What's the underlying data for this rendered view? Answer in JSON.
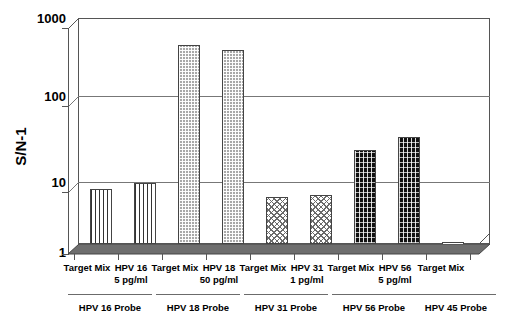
{
  "chart_data": {
    "type": "bar",
    "title": "",
    "xlabel": "",
    "ylabel": "S/N-1",
    "yscale": "log",
    "ylim": [
      1,
      1000
    ],
    "yticks": [
      "1000",
      "100",
      "10",
      "1"
    ],
    "grid": true,
    "legend": "none",
    "categories": [
      "Target Mix",
      "HPV 16 5 pg/ml",
      "Target Mix",
      "HPV 18 50 pg/ml",
      "Target Mix",
      "HPV 31 1 pg/ml",
      "Target Mix",
      "HPV 56 5 pg/ml",
      "Target Mix"
    ],
    "values": [
      4.4,
      5.1,
      205,
      178,
      3.5,
      3.7,
      12.5,
      17.5,
      1.0
    ],
    "bars": [
      {
        "label_line1": "Target Mix",
        "label_line2": "",
        "value": 4.4,
        "pattern": "vertical-lines",
        "group": "HPV 16 Probe"
      },
      {
        "label_line1": "HPV 16",
        "label_line2": "5 pg/ml",
        "value": 5.1,
        "pattern": "vertical-lines",
        "group": "HPV 16 Probe"
      },
      {
        "label_line1": "Target Mix",
        "label_line2": "",
        "value": 205,
        "pattern": "gray-stipple",
        "group": "HPV 18 Probe"
      },
      {
        "label_line1": "HPV 18",
        "label_line2": "50 pg/ml",
        "value": 178,
        "pattern": "gray-stipple",
        "group": "HPV 18 Probe"
      },
      {
        "label_line1": "Target Mix",
        "label_line2": "",
        "value": 3.5,
        "pattern": "wave",
        "group": "HPV 31 Probe"
      },
      {
        "label_line1": "HPV 31",
        "label_line2": "1 pg/ml",
        "value": 3.7,
        "pattern": "wave",
        "group": "HPV 31 Probe"
      },
      {
        "label_line1": "Target Mix",
        "label_line2": "",
        "value": 12.5,
        "pattern": "dark-stipple",
        "group": "HPV 56 Probe"
      },
      {
        "label_line1": "HPV 56",
        "label_line2": "5 pg/ml",
        "value": 17.5,
        "pattern": "dark-stipple",
        "group": "HPV 56 Probe"
      },
      {
        "label_line1": "Target Mix",
        "label_line2": "",
        "value": 1.0,
        "pattern": "empty",
        "group": "HPV 45 Probe"
      }
    ],
    "groups": [
      {
        "label": "HPV 16 Probe",
        "bars": [
          0,
          1
        ]
      },
      {
        "label": "HPV 18 Probe",
        "bars": [
          2,
          3
        ]
      },
      {
        "label": "HPV 31 Probe",
        "bars": [
          4,
          5
        ]
      },
      {
        "label": "HPV 56 Probe",
        "bars": [
          6,
          7
        ]
      },
      {
        "label": "HPV 45 Probe",
        "bars": [
          8
        ]
      }
    ],
    "colors": {
      "axis": "#555555",
      "grid": "#777777",
      "text": "#000000",
      "floor": "#6e6e6e",
      "bar_outline": "#444444"
    }
  }
}
